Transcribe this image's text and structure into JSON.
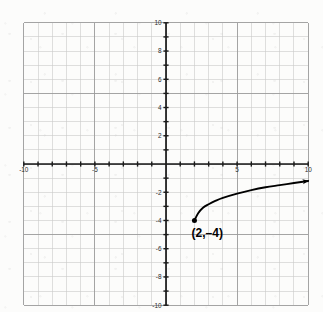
{
  "chart_data": {
    "type": "line",
    "title": "",
    "xlabel": "",
    "ylabel": "",
    "xlim": [
      -10,
      10
    ],
    "ylim": [
      -10,
      10
    ],
    "grid": true,
    "grid_step": 1,
    "major_grid_step": 5,
    "legend": "none",
    "x_ticks": [
      -10,
      -5,
      5,
      10
    ],
    "y_ticks": [
      10,
      8,
      6,
      4,
      2,
      -2,
      -4,
      -6,
      -8,
      -10
    ],
    "x_tick_labels": [
      "-10",
      "-5",
      "5",
      "10"
    ],
    "y_tick_labels": [
      "10",
      "8",
      "6",
      "4",
      "2",
      "-2",
      "-4",
      "-6",
      "-8",
      "-10"
    ],
    "series": [
      {
        "name": "square-root-curve",
        "style": "solid-curve-with-arrow",
        "color": "#000000",
        "endpoint_marker": "filled-dot",
        "arrow_end": "right",
        "points": [
          {
            "x": 2.0,
            "y": -4.0
          },
          {
            "x": 2.25,
            "y": -3.5
          },
          {
            "x": 2.6,
            "y": -3.1
          },
          {
            "x": 3.0,
            "y": -2.85
          },
          {
            "x": 3.5,
            "y": -2.6
          },
          {
            "x": 4.0,
            "y": -2.4
          },
          {
            "x": 5.0,
            "y": -2.1
          },
          {
            "x": 6.0,
            "y": -1.85
          },
          {
            "x": 7.0,
            "y": -1.65
          },
          {
            "x": 8.0,
            "y": -1.5
          },
          {
            "x": 9.0,
            "y": -1.35
          },
          {
            "x": 10.0,
            "y": -1.2
          }
        ]
      }
    ],
    "annotations": [
      {
        "name": "start-point-label",
        "text": "(2,–4)",
        "x": 2.0,
        "y": -4.0,
        "label_x": 2.9,
        "label_y": -5.2
      }
    ]
  },
  "axes": {
    "x_axis_label": "",
    "y_axis_label": "",
    "origin_label": ""
  },
  "colors": {
    "background": "#fcfcfb",
    "minor_grid": "#c9c9c9",
    "major_grid": "#9a9a9a",
    "axis": "#1a1a1a",
    "curve": "#000000",
    "tick_text": "#2b2b2b",
    "annotation_text": "#000000"
  }
}
